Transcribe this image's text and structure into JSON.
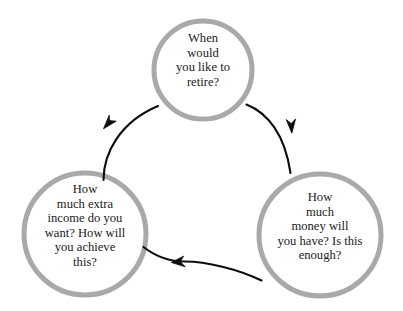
{
  "diagram": {
    "type": "cycle",
    "direction": "clockwise",
    "background_color": "#ffffff",
    "circle_stroke_color": "#a9a9a9",
    "arrow_color": "#0d0d0d",
    "text_color": "#1a1a1a",
    "nodes": [
      {
        "id": "retire",
        "position": "top",
        "lines": [
          "When",
          "would",
          "you like to",
          "retire?"
        ],
        "text": "When would you like to retire?",
        "center": {
          "x": 203,
          "y": 70
        },
        "radius": 49
      },
      {
        "id": "money",
        "position": "bottom-right",
        "lines": [
          "How",
          "much",
          "money will",
          "you have? Is this",
          "enough?"
        ],
        "text": "How much money will you have? Is this enough?",
        "center": {
          "x": 320,
          "y": 235
        },
        "radius": 61
      },
      {
        "id": "income",
        "position": "bottom-left",
        "lines": [
          "How",
          "much extra",
          "income do you",
          "want? How will",
          "you achieve",
          "this?"
        ],
        "text": "How much extra income do you want? How will you achieve this?",
        "center": {
          "x": 85,
          "y": 234
        },
        "radius": 61
      }
    ],
    "arrows": [
      {
        "id": "retire-to-money",
        "from": "retire",
        "to": "money",
        "direction": "down-right"
      },
      {
        "id": "money-to-income",
        "from": "money",
        "to": "income",
        "direction": "left"
      },
      {
        "id": "income-to-retire",
        "from": "income",
        "to": "retire",
        "direction": "up-right"
      }
    ]
  }
}
